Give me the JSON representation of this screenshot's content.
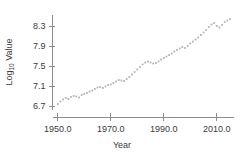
{
  "chart_data": {
    "type": "scatter",
    "title": "",
    "xlabel": "Year",
    "ylabel": "Log10 Value",
    "ylabel_base": "Log",
    "ylabel_sub": "10",
    "ylabel_rest": " Value",
    "xlim": [
      1948.0,
      2016.5
    ],
    "ylim": [
      6.62,
      8.52
    ],
    "xticks": [
      1950.0,
      1970.0,
      1990.0,
      2010.0
    ],
    "xtick_labels": [
      "1950.0",
      "1970.0",
      "1990.0",
      "2010.0"
    ],
    "yticks": [
      6.7,
      7.1,
      7.5,
      7.9,
      8.3
    ],
    "ytick_labels": [
      "6.7",
      "7.1",
      "7.5",
      "7.9",
      "8.3"
    ],
    "grid": false,
    "legend": false,
    "marker": "dot",
    "marker_color": "#b3b3b3",
    "axis_color": "#8c8c8c",
    "text_color": "#3b3b3b",
    "x": [
      1950,
      1951,
      1952,
      1953,
      1954,
      1955,
      1956,
      1957,
      1958,
      1959,
      1960,
      1961,
      1962,
      1963,
      1964,
      1965,
      1966,
      1967,
      1968,
      1969,
      1970,
      1971,
      1972,
      1973,
      1974,
      1975,
      1976,
      1977,
      1978,
      1979,
      1980,
      1981,
      1982,
      1983,
      1984,
      1985,
      1986,
      1987,
      1988,
      1989,
      1990,
      1991,
      1992,
      1993,
      1994,
      1995,
      1996,
      1997,
      1998,
      1999,
      2000,
      2001,
      2002,
      2003,
      2004,
      2005,
      2006,
      2007,
      2008,
      2009,
      2010,
      2011,
      2012,
      2013,
      2014,
      2015
    ],
    "y": [
      6.74,
      6.79,
      6.83,
      6.86,
      6.84,
      6.88,
      6.9,
      6.89,
      6.87,
      6.92,
      6.94,
      6.96,
      6.99,
      7.01,
      7.04,
      7.07,
      7.08,
      7.06,
      7.09,
      7.12,
      7.13,
      7.16,
      7.19,
      7.22,
      7.21,
      7.2,
      7.24,
      7.28,
      7.33,
      7.38,
      7.43,
      7.48,
      7.53,
      7.57,
      7.59,
      7.57,
      7.55,
      7.56,
      7.59,
      7.63,
      7.66,
      7.69,
      7.72,
      7.75,
      7.79,
      7.82,
      7.85,
      7.88,
      7.86,
      7.9,
      7.95,
      7.99,
      8.03,
      8.07,
      8.12,
      8.17,
      8.22,
      8.28,
      8.33,
      8.36,
      8.3,
      8.27,
      8.32,
      8.38,
      8.41,
      8.44
    ]
  }
}
